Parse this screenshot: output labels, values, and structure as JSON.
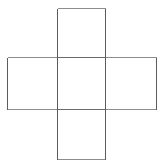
{
  "figure": {
    "title": "Cross-shaped net of five squares",
    "kind": "line-drawing",
    "background_color": "#ffffff",
    "canvas": {
      "width": 163,
      "height": 168
    },
    "stroke_colors": {
      "vertical_lines": "#5c5c5c",
      "horizontal_lines": "#8d8d8d",
      "interior_lines": "#6a6a6a"
    },
    "stroke_width": 1,
    "labels": [],
    "annotations": [],
    "geometry": {
      "vertical_strip": {
        "x1": 57,
        "y1": 8,
        "x2": 105,
        "y2": 159
      },
      "horizontal_strip": {
        "x1": 7,
        "y1": 57,
        "x2": 156,
        "y2": 109
      },
      "interior_vertical_x": [
        57,
        105
      ],
      "interior_horizontal_y": [
        57,
        109
      ]
    },
    "faces": [
      {
        "id": "top-square",
        "name": "top",
        "x": 57,
        "y": 8,
        "width": 48,
        "height": 49
      },
      {
        "id": "left-square",
        "name": "left",
        "x": 7,
        "y": 57,
        "width": 50,
        "height": 52
      },
      {
        "id": "center-square",
        "name": "center",
        "x": 57,
        "y": 57,
        "width": 48,
        "height": 52
      },
      {
        "id": "right-square",
        "name": "right",
        "x": 105,
        "y": 57,
        "width": 51,
        "height": 52
      },
      {
        "id": "bottom-square",
        "name": "bottom",
        "x": 57,
        "y": 109,
        "width": 48,
        "height": 50
      }
    ],
    "edges": [
      {
        "id": "top-top",
        "orientation": "horizontal",
        "x1": 57,
        "y1": 8,
        "x2": 105,
        "y2": 8
      },
      {
        "id": "top-left",
        "orientation": "vertical",
        "x1": 57,
        "y1": 8,
        "x2": 57,
        "y2": 57
      },
      {
        "id": "top-right",
        "orientation": "vertical",
        "x1": 105,
        "y1": 8,
        "x2": 105,
        "y2": 57
      },
      {
        "id": "upper-horizontal",
        "orientation": "horizontal",
        "x1": 7,
        "y1": 57,
        "x2": 156,
        "y2": 57
      },
      {
        "id": "left-left",
        "orientation": "vertical",
        "x1": 7,
        "y1": 57,
        "x2": 7,
        "y2": 109
      },
      {
        "id": "right-right",
        "orientation": "vertical",
        "x1": 156,
        "y1": 57,
        "x2": 156,
        "y2": 109
      },
      {
        "id": "center-left",
        "orientation": "vertical",
        "x1": 57,
        "y1": 57,
        "x2": 57,
        "y2": 109
      },
      {
        "id": "center-right",
        "orientation": "vertical",
        "x1": 105,
        "y1": 57,
        "x2": 105,
        "y2": 109
      },
      {
        "id": "lower-horizontal",
        "orientation": "horizontal",
        "x1": 7,
        "y1": 109,
        "x2": 156,
        "y2": 109
      },
      {
        "id": "bottom-left",
        "orientation": "vertical",
        "x1": 57,
        "y1": 109,
        "x2": 57,
        "y2": 159
      },
      {
        "id": "bottom-right",
        "orientation": "vertical",
        "x1": 105,
        "y1": 109,
        "x2": 105,
        "y2": 159
      },
      {
        "id": "bottom-bottom",
        "orientation": "horizontal",
        "x1": 57,
        "y1": 159,
        "x2": 105,
        "y2": 159
      }
    ]
  }
}
